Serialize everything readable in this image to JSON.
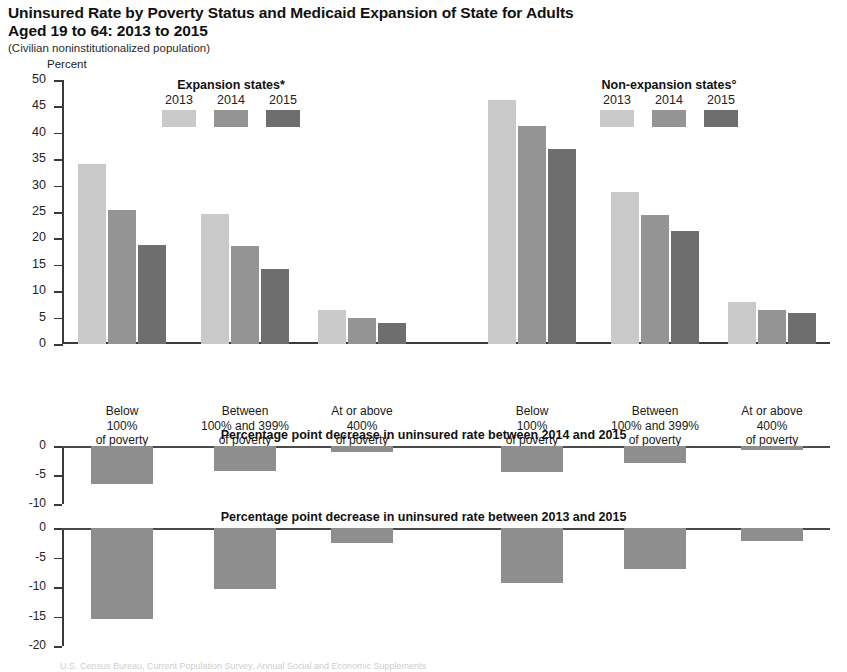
{
  "title": {
    "line1": "Uninsured Rate by Poverty Status and Medicaid Expansion of State for Adults",
    "line2": "Aged 19 to 64: 2013 to 2015",
    "subtitle": "(Civilian noninstitutionalized population)"
  },
  "axis": {
    "y_label": "Percent",
    "y_ticks": [
      "50",
      "45",
      "40",
      "35",
      "30",
      "25",
      "20",
      "15",
      "10",
      "5",
      "0"
    ]
  },
  "legends": [
    {
      "title": "Expansion states*",
      "years": [
        "2013",
        "2014",
        "2015"
      ],
      "colors": [
        "#c9c9c9",
        "#949494",
        "#6e6e6e"
      ]
    },
    {
      "title": "Non-expansion states°",
      "years": [
        "2013",
        "2014",
        "2015"
      ],
      "colors": [
        "#c9c9c9",
        "#949494",
        "#6e6e6e"
      ]
    }
  ],
  "categories": [
    {
      "l1": "Below",
      "l2": "100%",
      "l3": "of poverty"
    },
    {
      "l1": "Between",
      "l2": "100% and 399%",
      "l3": "of poverty"
    },
    {
      "l1": "At or above",
      "l2": "400%",
      "l3": "of poverty"
    },
    {
      "l1": "Below",
      "l2": "100%",
      "l3": "of poverty"
    },
    {
      "l1": "Between",
      "l2": "100% and 399%",
      "l3": "of poverty"
    },
    {
      "l1": "At or above",
      "l2": "400%",
      "l3": "of poverty"
    }
  ],
  "subpanels": [
    {
      "title": "Percentage point decrease in uninsured rate between 2014 and 2015",
      "y_ticks": [
        "0",
        "-5",
        "-10"
      ],
      "ylim": [
        -10,
        0
      ]
    },
    {
      "title": "Percentage point decrease in uninsured rate between 2013 and 2015",
      "y_ticks": [
        "0",
        "-5",
        "-10",
        "-15",
        "-20"
      ],
      "ylim": [
        -20,
        0
      ]
    }
  ],
  "footer": {
    "fragment": "U.S. Census Bureau, Current Population Survey, Annual Social and Economic Supplements"
  },
  "chart_data": {
    "type": "bar",
    "title": "Uninsured Rate by Poverty Status and Medicaid Expansion of State for Adults Aged 19 to 64: 2013 to 2015",
    "subtitle": "(Civilian noninstitutionalized population)",
    "xlabel": "",
    "ylabel": "Percent",
    "ylim": [
      0,
      50
    ],
    "ytick_step": 5,
    "grid": false,
    "legend_position": "top-inside",
    "panel_groups": [
      "Expansion states*",
      "Non-expansion states°"
    ],
    "categories": [
      "Below 100% of poverty",
      "Between 100% and 399% of poverty",
      "At or above 400% of poverty",
      "Below 100% of poverty",
      "Between 100% and 399% of poverty",
      "At or above 400% of poverty"
    ],
    "series": [
      {
        "name": "2013",
        "color": "#c9c9c9",
        "values": [
          34.1,
          24.6,
          6.4,
          46.2,
          28.7,
          8.0
        ]
      },
      {
        "name": "2014",
        "color": "#949494",
        "values": [
          25.3,
          18.5,
          5.0,
          41.3,
          24.4,
          6.5
        ]
      },
      {
        "name": "2015",
        "color": "#6e6e6e",
        "values": [
          18.7,
          14.2,
          3.9,
          36.9,
          21.4,
          5.8
        ]
      }
    ],
    "subcharts": [
      {
        "type": "bar",
        "title": "Percentage point decrease in uninsured rate between 2014 and 2015",
        "ylim": [
          -10,
          0
        ],
        "ytick_step": 5,
        "categories": [
          "Below 100% of poverty",
          "Between 100% and 399% of poverty",
          "At or above 400% of poverty",
          "Below 100% of poverty",
          "Between 100% and 399% of poverty",
          "At or above 400% of poverty"
        ],
        "values": [
          -6.6,
          -4.3,
          -1.1,
          -4.4,
          -3.0,
          -0.7
        ],
        "color": "#8e8e8e"
      },
      {
        "type": "bar",
        "title": "Percentage point decrease in uninsured rate between 2013 and 2015",
        "ylim": [
          -20,
          0
        ],
        "ytick_step": 5,
        "categories": [
          "Below 100% of poverty",
          "Between 100% and 399% of poverty",
          "At or above 400% of poverty",
          "Below 100% of poverty",
          "Between 100% and 399% of poverty",
          "At or above 400% of poverty"
        ],
        "values": [
          -15.4,
          -10.4,
          -2.5,
          -9.3,
          -6.9,
          -2.2
        ],
        "color": "#8e8e8e"
      }
    ]
  }
}
